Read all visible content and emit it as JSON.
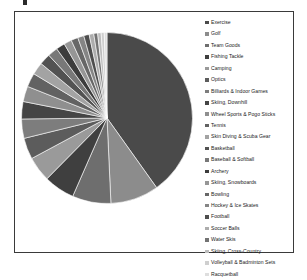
{
  "chart_data": {
    "type": "pie",
    "title": "",
    "legend_position": "right",
    "grid": false,
    "categories": [
      "Exercise",
      "Golf",
      "Team Goods",
      "Fishing Tackle",
      "Camping",
      "Optics",
      "Billiards & Indoor Games",
      "Skiing, Downhill",
      "Wheel Sports & Pogo Sticks",
      "Tennis",
      "Skin Diving & Scuba Gear",
      "Basketball",
      "Baseball & Softball",
      "Archery",
      "Skiing, Snowboards",
      "Bowling",
      "Hockey & Ice Skates",
      "Football",
      "Soccer Balls",
      "Water Skis",
      "Skiing, Cross-Country",
      "Volleyball & Badminton Sets",
      "Racquetball"
    ],
    "values": [
      55.0,
      12.5,
      10.0,
      8.0,
      6.5,
      5.5,
      5.0,
      4.5,
      4.0,
      3.6,
      3.2,
      2.9,
      2.6,
      2.3,
      2.0,
      1.8,
      1.6,
      1.4,
      1.2,
      1.0,
      0.9,
      0.8,
      0.7
    ],
    "colors": [
      "#4a4a4a",
      "#8c8c8c",
      "#6e6e6e",
      "#3f3f3f",
      "#9a9a9a",
      "#5c5c5c",
      "#7d7d7d",
      "#454545",
      "#8f8f8f",
      "#626262",
      "#a3a3a3",
      "#525252",
      "#787878",
      "#3c3c3c",
      "#969696",
      "#676767",
      "#858585",
      "#4e4e4e",
      "#adadad",
      "#737373",
      "#bdbdbd",
      "#cfcfcf",
      "#dedede"
    ],
    "units": "percent",
    "start_angle_deg": 0,
    "direction": "clockwise"
  },
  "legend": {
    "items": [
      {
        "label": "Exercise",
        "color": "#4a4a4a"
      },
      {
        "label": "Golf",
        "color": "#8c8c8c"
      },
      {
        "label": "Team Goods",
        "color": "#6e6e6e"
      },
      {
        "label": "Fishing Tackle",
        "color": "#3f3f3f"
      },
      {
        "label": "Camping",
        "color": "#9a9a9a"
      },
      {
        "label": "Optics",
        "color": "#5c5c5c"
      },
      {
        "label": "Billiards & Indoor Games",
        "color": "#7d7d7d"
      },
      {
        "label": "Skiing, Downhill",
        "color": "#454545"
      },
      {
        "label": "Wheel Sports & Pogo Sticks",
        "color": "#8f8f8f"
      },
      {
        "label": "Tennis",
        "color": "#626262"
      },
      {
        "label": "Skin Diving & Scuba Gear",
        "color": "#a3a3a3"
      },
      {
        "label": "Basketball",
        "color": "#525252"
      },
      {
        "label": "Baseball & Softball",
        "color": "#787878"
      },
      {
        "label": "Archery",
        "color": "#3c3c3c"
      },
      {
        "label": "Skiing, Snowboards",
        "color": "#969696"
      },
      {
        "label": "Bowling",
        "color": "#676767"
      },
      {
        "label": "Hockey & Ice Skates",
        "color": "#858585"
      },
      {
        "label": "Football",
        "color": "#4e4e4e"
      },
      {
        "label": "Soccer Balls",
        "color": "#adadad"
      },
      {
        "label": "Water Skis",
        "color": "#737373"
      },
      {
        "label": "Skiing, Cross-Country",
        "color": "#bdbdbd"
      },
      {
        "label": "Volleyball & Badminton Sets",
        "color": "#cfcfcf"
      },
      {
        "label": "Racquetball",
        "color": "#dedede"
      }
    ]
  },
  "frame": {
    "border_color": "#3a3a3a",
    "background": "#ffffff"
  }
}
